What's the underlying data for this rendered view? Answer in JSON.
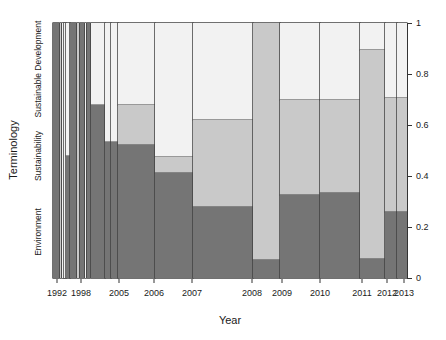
{
  "chart_data": {
    "type": "bar",
    "subtype": "spineplot-stacked-proportions",
    "title": "",
    "xlabel": "Year",
    "ylabel": "Terminology",
    "grid": false,
    "legend": "none (categories labeled on left axis)",
    "colors": {
      "environment": "#757575",
      "sustainability": "#c9c9c9",
      "sustainable_development": "#f2f2f2",
      "border": "#404040",
      "axis": "#333333"
    },
    "categories": [
      "Environment",
      "Sustainability",
      "Sustainable Development"
    ],
    "category_axis_labels": [
      {
        "label": "Environment",
        "center_value": 0.18
      },
      {
        "label": "Sustainability",
        "center_value": 0.48
      },
      {
        "label": "Sustainable Development",
        "center_value": 0.82
      }
    ],
    "y_axis_right": {
      "ticks": [
        0,
        0.2,
        0.4,
        0.6,
        0.8,
        1
      ],
      "tick_labels": [
        "0",
        "0.2",
        "0.4",
        "0.6",
        "0.8",
        "1"
      ],
      "range": [
        0,
        1
      ]
    },
    "x_tick_labels": [
      {
        "label": "1992",
        "pos": 0.0113
      },
      {
        "label": "1998",
        "pos": 0.0791
      },
      {
        "label": "2005",
        "pos": 0.1864
      },
      {
        "label": "2006",
        "pos": 0.2853
      },
      {
        "label": "2007",
        "pos": 0.3927
      },
      {
        "label": "2008",
        "pos": 0.5621
      },
      {
        "label": "2009",
        "pos": 0.6469
      },
      {
        "label": "2010",
        "pos": 0.7542
      },
      {
        "label": "2011",
        "pos": 0.8729
      },
      {
        "label": "2012",
        "pos": 0.9435
      },
      {
        "label": "2013",
        "pos": 0.9915
      }
    ],
    "bars": [
      {
        "year": "1992",
        "x0": 0.0,
        "x1": 0.017,
        "environment": 1.0,
        "sustainability": 0.0,
        "sustainable_development": 0.0
      },
      {
        "year": "1993",
        "x0": 0.019,
        "x1": 0.023,
        "environment": 0.0,
        "sustainability": 1.0,
        "sustainable_development": 0.0
      },
      {
        "year": "1994",
        "x0": 0.025,
        "x1": 0.03,
        "environment": 0.0,
        "sustainability": 0.0,
        "sustainable_development": 1.0
      },
      {
        "year": "1995",
        "x0": 0.032,
        "x1": 0.037,
        "environment": 0.0,
        "sustainability": 0.0,
        "sustainable_development": 1.0
      },
      {
        "year": "1996",
        "x0": 0.038,
        "x1": 0.047,
        "environment": 0.48,
        "sustainability": 0.0,
        "sustainable_development": 0.52
      },
      {
        "year": "1997",
        "x0": 0.049,
        "x1": 0.066,
        "environment": 1.0,
        "sustainability": 0.0,
        "sustainable_development": 0.0
      },
      {
        "year": "1998",
        "x0": 0.068,
        "x1": 0.073,
        "environment": 0.0,
        "sustainability": 1.0,
        "sustainable_development": 0.0
      },
      {
        "year": "1999",
        "x0": 0.075,
        "x1": 0.088,
        "environment": 1.0,
        "sustainability": 0.0,
        "sustainable_development": 0.0
      },
      {
        "year": "2000",
        "x0": 0.089,
        "x1": 0.093,
        "environment": 0.0,
        "sustainability": 0.0,
        "sustainable_development": 1.0
      },
      {
        "year": "2001",
        "x0": 0.095,
        "x1": 0.105,
        "environment": 1.0,
        "sustainability": 0.0,
        "sustainable_development": 0.0
      },
      {
        "year": "2002",
        "x0": 0.106,
        "x1": 0.147,
        "environment": 0.68,
        "sustainability": 0.0,
        "sustainable_development": 0.32
      },
      {
        "year": "2003",
        "x0": 0.147,
        "x1": 0.164,
        "environment": 0.535,
        "sustainability": 0.0,
        "sustainable_development": 0.465
      },
      {
        "year": "2004",
        "x0": 0.164,
        "x1": 0.184,
        "environment": 0.535,
        "sustainability": 0.0,
        "sustainable_development": 0.465
      },
      {
        "year": "2005",
        "x0": 0.184,
        "x1": 0.288,
        "environment": 0.52,
        "sustainability": 0.16,
        "sustainable_development": 0.32
      },
      {
        "year": "2006",
        "x0": 0.288,
        "x1": 0.395,
        "environment": 0.41,
        "sustainability": 0.065,
        "sustainable_development": 0.525
      },
      {
        "year": "2007",
        "x0": 0.395,
        "x1": 0.565,
        "environment": 0.28,
        "sustainability": 0.34,
        "sustainable_development": 0.38
      },
      {
        "year": "2008",
        "x0": 0.565,
        "x1": 0.641,
        "environment": 0.07,
        "sustainability": 0.93,
        "sustainable_development": 0.0
      },
      {
        "year": "2009",
        "x0": 0.641,
        "x1": 0.754,
        "environment": 0.325,
        "sustainability": 0.375,
        "sustainable_development": 0.3
      },
      {
        "year": "2010",
        "x0": 0.754,
        "x1": 0.867,
        "environment": 0.335,
        "sustainability": 0.365,
        "sustainable_development": 0.3
      },
      {
        "year": "2011",
        "x0": 0.867,
        "x1": 0.938,
        "environment": 0.075,
        "sustainability": 0.82,
        "sustainable_development": 0.105
      },
      {
        "year": "2012",
        "x0": 0.938,
        "x1": 0.972,
        "environment": 0.26,
        "sustainability": 0.445,
        "sustainable_development": 0.295
      },
      {
        "year": "2013",
        "x0": 0.972,
        "x1": 1.0,
        "environment": 0.26,
        "sustainability": 0.445,
        "sustainable_development": 0.295
      }
    ]
  }
}
